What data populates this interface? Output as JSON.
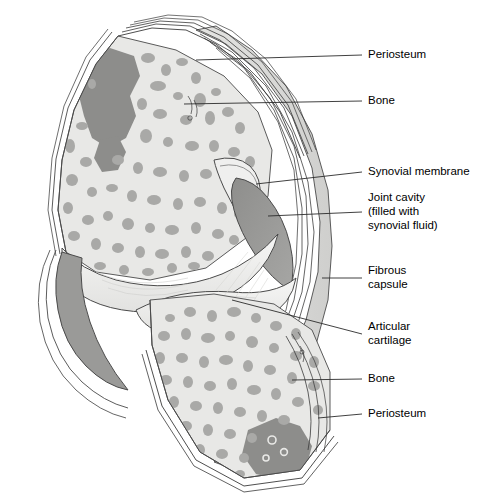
{
  "figure": {
    "background_color": "#ffffff",
    "text_color": "#000000"
  },
  "palette": {
    "bone_matrix": "#e8e8e6",
    "trabeculae": "#a9a9a7",
    "marrow_dark": "#8d8d8b",
    "joint_cavity": "#989896",
    "cartilage": "#efefee",
    "capsule_fill": "#dcdcda",
    "outline": "#4a4a4a",
    "periosteum_line": "#3a3a3a"
  },
  "labels": [
    {
      "id": "periosteum-top",
      "text": "Periosteum",
      "x": 368,
      "y": 55,
      "lines": [
        "Periosteum"
      ]
    },
    {
      "id": "bone-top",
      "text": "Bone",
      "x": 368,
      "y": 101,
      "lines": [
        "Bone"
      ]
    },
    {
      "id": "synovial-membrane",
      "text": "Synovial membrane",
      "x": 368,
      "y": 172,
      "lines": [
        "Synovial membrane"
      ]
    },
    {
      "id": "joint-cavity",
      "text": "Joint cavity (filled with synovial fluid)",
      "x": 368,
      "y": 205,
      "lines": [
        "Joint cavity",
        "(filled with",
        "synovial fluid)"
      ]
    },
    {
      "id": "fibrous-capsule",
      "text": "Fibrous capsule",
      "x": 368,
      "y": 273,
      "lines": [
        "Fibrous",
        "capsule"
      ]
    },
    {
      "id": "articular-cartilage",
      "text": "Articular cartilage",
      "x": 368,
      "y": 328,
      "lines": [
        "Articular",
        "cartilage"
      ]
    },
    {
      "id": "bone-bottom",
      "text": "Bone",
      "x": 368,
      "y": 379,
      "lines": [
        "Bone"
      ]
    },
    {
      "id": "periosteum-bottom",
      "text": "Periosteum",
      "x": 368,
      "y": 414,
      "lines": [
        "Periosteum"
      ]
    }
  ]
}
